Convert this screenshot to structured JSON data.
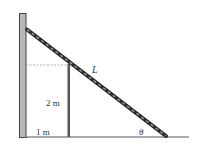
{
  "diagram": {
    "type": "physics-ladder-over-fence",
    "labels": {
      "ladder_length": "L",
      "post_height": "2 m",
      "post_distance": "1 m",
      "angle": "θ"
    },
    "colors": {
      "background": "#ffffff",
      "wall_fill": "#b8b8b8",
      "wall_stroke": "#444444",
      "ladder_outer": "#2a2a2a",
      "ladder_inner": "#9a9a9a",
      "post": "#555555",
      "ground": "#555555",
      "dashed": "#999999",
      "text": "#333333"
    }
  }
}
